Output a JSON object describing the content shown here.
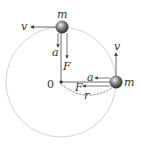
{
  "diagram": {
    "center_label": "0",
    "radius_label": "r",
    "top_body": {
      "mass_label": "m",
      "velocity_label": "v",
      "acceleration_label": "a",
      "force_label": "F"
    },
    "right_body": {
      "mass_label": "m",
      "velocity_label": "v",
      "acceleration_label": "a",
      "force_label": "F"
    },
    "colors": {
      "circle": "#c8c8c8",
      "line": "#444444",
      "ball": "#5a5a5a"
    }
  }
}
